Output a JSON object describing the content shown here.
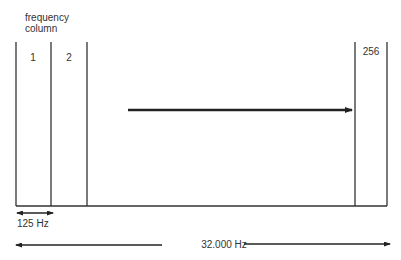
{
  "diagram": {
    "title_line1": "frequency",
    "title_line2": "column",
    "columns": [
      {
        "label": "1"
      },
      {
        "label": "2"
      },
      {
        "label": "256"
      }
    ],
    "arrow_label": "progression",
    "bin_width_label": "125 Hz",
    "total_range_label": "32.000 Hz",
    "line_color": "#333333"
  }
}
